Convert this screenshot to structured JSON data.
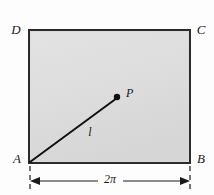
{
  "figure": {
    "type": "geometry-diagram",
    "background_color": "#fdfdfd",
    "rectangle": {
      "name": "rectangle-ABCD",
      "fill_color": "#dcdcdc",
      "stroke_color": "#2b2b2b",
      "stroke_width": 2,
      "left": 29,
      "top": 30,
      "right": 190,
      "bottom": 163,
      "width": 161,
      "height": 133
    },
    "vertices": [
      {
        "id": "A",
        "label": "A",
        "x": 29,
        "y": 163,
        "label_x": 17,
        "label_y": 160
      },
      {
        "id": "B",
        "label": "B",
        "x": 190,
        "y": 163,
        "label_x": 201,
        "label_y": 160
      },
      {
        "id": "C",
        "label": "C",
        "x": 190,
        "y": 30,
        "label_x": 201,
        "label_y": 31
      },
      {
        "id": "D",
        "label": "D",
        "x": 29,
        "y": 30,
        "label_x": 16,
        "label_y": 31
      }
    ],
    "segment": {
      "name": "segment-AP",
      "label": "l",
      "from": "A",
      "to": "P",
      "stroke_color": "#111111",
      "stroke_width": 2,
      "x1": 30,
      "y1": 162,
      "x2": 117,
      "y2": 98,
      "label_x": 90,
      "label_y": 133
    },
    "point_p": {
      "name": "point-P",
      "label": "P",
      "x": 117,
      "y": 97,
      "radius": 3,
      "color": "#111111",
      "label_x": 126,
      "label_y": 94
    },
    "dimension": {
      "name": "dimension-2pi",
      "label": "2π",
      "value": "2π",
      "measures": "AB",
      "line_y": 181,
      "x_start": 30,
      "x_end": 190,
      "label_x": 110,
      "label_y": 180,
      "stroke_color": "#1a1a1a",
      "stroke_width": 1,
      "extension_lines": [
        {
          "x": 30,
          "y_top": 166,
          "y_bottom": 190
        },
        {
          "x": 190,
          "y_top": 166,
          "y_bottom": 190
        }
      ],
      "arrow_direction": "outward"
    }
  }
}
